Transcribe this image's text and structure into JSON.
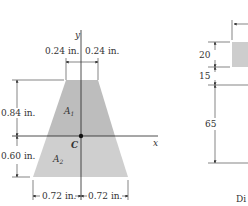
{
  "figure_left": {
    "axis_y_label": "y",
    "axis_x_label": "x",
    "centroid_label": "C",
    "area1_label": "A",
    "area1_sub": "1",
    "area2_label": "A",
    "area2_sub": "2",
    "dim_top_left": "0.24 in.",
    "dim_top_right": "0.24 in.",
    "dim_upper_height": "0.84 in.",
    "dim_lower_height": "0.60 in.",
    "dim_bottom_left": "0.72 in.",
    "dim_bottom_right": "0.72 in.",
    "fill_color": "#c8c8c8"
  },
  "figure_right": {
    "dim_1": "20",
    "dim_2": "15",
    "dim_3": "65",
    "caption_partial": "Di"
  }
}
